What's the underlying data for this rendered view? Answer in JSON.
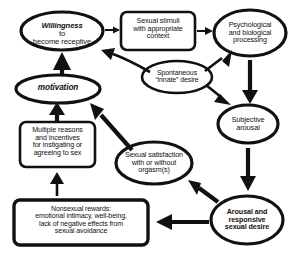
{
  "diagram": {
    "style": "hand-drawn flowchart, black on white",
    "colors": {
      "stroke": "#111111",
      "background": "#ffffff"
    },
    "nodes": [
      {
        "id": "willingness",
        "shape": "ellipse",
        "lines": [
          "Willingness to",
          "become receptive"
        ],
        "emphasis_word": "Willingness"
      },
      {
        "id": "sexual-stimuli",
        "shape": "rounded-rectangle",
        "lines": [
          "Sexual stimuli",
          "with appropriate",
          "context"
        ]
      },
      {
        "id": "processing",
        "shape": "ellipse",
        "lines": [
          "Psychological",
          "and biological",
          "processing"
        ]
      },
      {
        "id": "spontaneous-desire",
        "shape": "ellipse",
        "lines": [
          "Spontaneous",
          "“innate” desire"
        ]
      },
      {
        "id": "subjective-arousal",
        "shape": "ellipse",
        "lines": [
          "Subjective",
          "arousal"
        ]
      },
      {
        "id": "motivation",
        "shape": "ellipse",
        "lines": [
          "motivation"
        ]
      },
      {
        "id": "multiple-reasons",
        "shape": "rounded-rectangle",
        "lines": [
          "Multiple reasons",
          "and incentives",
          "for instigating or",
          "agreeing to sex"
        ]
      },
      {
        "id": "sexual-satisfaction",
        "shape": "ellipse",
        "lines": [
          "Sexual satisfaction",
          "with or without",
          "orgasm(s)"
        ]
      },
      {
        "id": "arousal-desire",
        "shape": "ellipse",
        "lines": [
          "Arousal and",
          "responsive",
          "sexual desire"
        ]
      },
      {
        "id": "nonsexual-rewards",
        "shape": "rounded-rectangle",
        "lines": [
          "Nonsexual rewards:",
          "emotional intimacy, well-being,",
          "lack of negative effects from",
          "sexual avoidance"
        ]
      }
    ],
    "edges": [
      {
        "from": "willingness",
        "to": "sexual-stimuli",
        "direction": "right"
      },
      {
        "from": "sexual-stimuli",
        "to": "processing",
        "direction": "right"
      },
      {
        "from": "processing",
        "to": "subjective-arousal",
        "direction": "down"
      },
      {
        "from": "subjective-arousal",
        "to": "arousal-desire",
        "direction": "down"
      },
      {
        "from": "arousal-desire",
        "to": "nonsexual-rewards",
        "direction": "left"
      },
      {
        "from": "nonsexual-rewards",
        "to": "multiple-reasons",
        "direction": "up"
      },
      {
        "from": "multiple-reasons",
        "to": "motivation",
        "direction": "up"
      },
      {
        "from": "motivation",
        "to": "willingness",
        "direction": "up"
      },
      {
        "from": "arousal-desire",
        "to": "sexual-satisfaction",
        "direction": "up-left"
      },
      {
        "from": "sexual-satisfaction",
        "to": "motivation",
        "direction": "up-left"
      },
      {
        "from": "spontaneous-desire",
        "to": "willingness",
        "direction": "up-left"
      },
      {
        "from": "spontaneous-desire",
        "to": "processing",
        "direction": "up-right"
      },
      {
        "from": "spontaneous-desire",
        "to": "subjective-arousal",
        "direction": "down-right"
      }
    ]
  }
}
